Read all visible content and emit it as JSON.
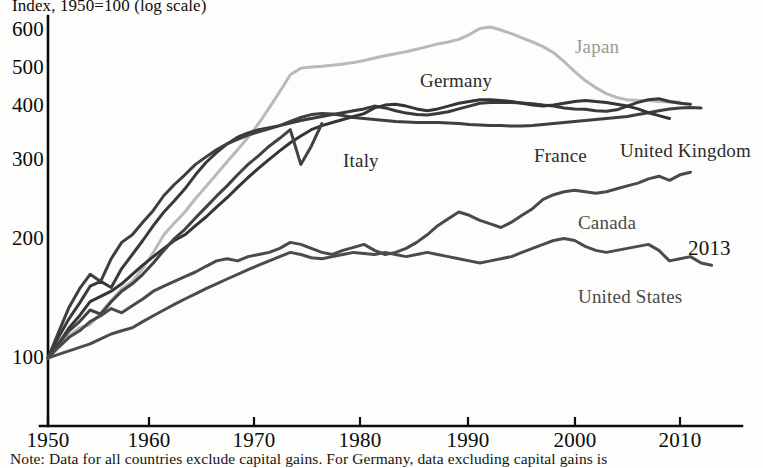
{
  "chart_data": {
    "type": "line",
    "title": "Index, 1950=100 (log scale)",
    "xlabel": "",
    "ylabel": "",
    "scale": "log",
    "grid": false,
    "legend_position": "inline-annotations",
    "xlim": [
      1950,
      2013
    ],
    "ylim": [
      90,
      650
    ],
    "x_ticks": [
      "1950",
      "1960",
      "1970",
      "1980",
      "1990",
      "2000",
      "2010"
    ],
    "y_ticks": [
      "100",
      "200",
      "300",
      "400",
      "500",
      "600"
    ],
    "end_year_annotation": "2013",
    "note": "Note: Data for all countries exclude capital gains. For Germany, data excluding capital gains is",
    "series": [
      {
        "name": "Japan",
        "color": "#b9b9b9",
        "label_x": 575,
        "label_y": 36,
        "x": [
          1950,
          1951,
          1952,
          1953,
          1954,
          1955,
          1956,
          1957,
          1958,
          1959,
          1960,
          1961,
          1962,
          1963,
          1964,
          1965,
          1966,
          1967,
          1968,
          1969,
          1970,
          1971,
          1972,
          1973,
          1974,
          1975,
          1976,
          1977,
          1978,
          1979,
          1980,
          1981,
          1982,
          1983,
          1984,
          1985,
          1986,
          1987,
          1988,
          1989,
          1990,
          1991,
          1992,
          1993,
          1994,
          1995,
          1996,
          1997,
          1998,
          1999,
          2000,
          2001,
          2002,
          2003,
          2004,
          2005,
          2006,
          2007,
          2008,
          2009,
          2010
        ],
        "values": [
          100,
          106,
          113,
          118,
          120,
          128,
          137,
          146,
          152,
          163,
          178,
          196,
          209,
          222,
          239,
          255,
          273,
          292,
          312,
          334,
          360,
          392,
          428,
          470,
          487,
          490,
          492,
          495,
          498,
          502,
          508,
          515,
          521,
          527,
          533,
          540,
          548,
          556,
          562,
          570,
          585,
          605,
          610,
          600,
          588,
          575,
          562,
          548,
          530,
          505,
          478,
          455,
          438,
          424,
          415,
          410,
          408,
          408,
          406,
          405,
          405
        ]
      },
      {
        "name": "Germany",
        "color": "#3a3a3a",
        "label_x": 420,
        "label_y": 70,
        "x": [
          1950,
          1951,
          1952,
          1953,
          1954,
          1955,
          1956,
          1957,
          1958,
          1959,
          1960,
          1961,
          1962,
          1963,
          1964,
          1965,
          1966,
          1967,
          1968,
          1969,
          1970,
          1971,
          1972,
          1973,
          1974,
          1975,
          1976,
          1977,
          1978,
          1979,
          1980,
          1981,
          1982,
          1983,
          1984,
          1985,
          1986,
          1987,
          1988,
          1989,
          1990,
          1991,
          1992,
          1993,
          1994,
          1995,
          1996,
          1997,
          1998,
          1999,
          2000,
          2001,
          2002,
          2003,
          2004,
          2005,
          2006,
          2007,
          2008,
          2009,
          2010,
          2011
        ],
        "values": [
          100,
          112,
          124,
          135,
          148,
          152,
          147,
          163,
          176,
          190,
          206,
          222,
          236,
          252,
          272,
          291,
          307,
          322,
          334,
          342,
          348,
          352,
          356,
          361,
          366,
          370,
          374,
          378,
          382,
          386,
          390,
          396,
          392,
          386,
          381,
          378,
          377,
          380,
          384,
          390,
          396,
          402,
          404,
          404,
          404,
          403,
          401,
          398,
          396,
          392,
          390,
          389,
          386,
          385,
          388,
          396,
          404,
          410,
          412,
          406,
          402,
          400
        ]
      },
      {
        "name": "France",
        "color": "#3f3f3f",
        "label_x": 534,
        "label_y": 145,
        "x": [
          1950,
          1951,
          1952,
          1953,
          1954,
          1955,
          1956,
          1957,
          1958,
          1959,
          1960,
          1961,
          1962,
          1963,
          1964,
          1965,
          1966,
          1967,
          1968,
          1969,
          1970,
          1971,
          1972,
          1973,
          1974,
          1975,
          1976,
          1977,
          1978,
          1979,
          1980,
          1981,
          1982,
          1983,
          1984,
          1985,
          1986,
          1987,
          1988,
          1989,
          1990,
          1991,
          1992,
          1993,
          1994,
          1995,
          1996,
          1997,
          1998,
          1999,
          2000,
          2001,
          2002,
          2003,
          2004,
          2005,
          2006,
          2007,
          2008,
          2009,
          2010,
          2011,
          2012
        ],
        "values": [
          100,
          115,
          132,
          146,
          158,
          152,
          172,
          188,
          196,
          210,
          224,
          243,
          258,
          272,
          288,
          300,
          312,
          322,
          330,
          338,
          344,
          350,
          356,
          364,
          372,
          378,
          380,
          379,
          376,
          372,
          370,
          368,
          366,
          364,
          363,
          362,
          362,
          362,
          361,
          360,
          358,
          357,
          356,
          356,
          355,
          355,
          356,
          358,
          360,
          362,
          364,
          366,
          368,
          370,
          372,
          374,
          378,
          382,
          386,
          390,
          392,
          393,
          392
        ]
      },
      {
        "name": "United Kingdom",
        "color": "#353535",
        "label_x": 620,
        "label_y": 140,
        "x": [
          1950,
          1951,
          1952,
          1953,
          1954,
          1955,
          1956,
          1957,
          1958,
          1959,
          1960,
          1961,
          1962,
          1963,
          1964,
          1965,
          1966,
          1967,
          1968,
          1969,
          1970,
          1971,
          1972,
          1973,
          1974,
          1975,
          1976,
          1977,
          1978,
          1979,
          1980,
          1981,
          1982,
          1983,
          1984,
          1985,
          1986,
          1987,
          1988,
          1989,
          1990,
          1991,
          1992,
          1993,
          1994,
          1995,
          1996,
          1997,
          1998,
          1999,
          2000,
          2001,
          2002,
          2003,
          2004,
          2005,
          2006,
          2007,
          2008,
          2009
        ],
        "values": [
          100,
          108,
          118,
          126,
          136,
          140,
          144,
          150,
          158,
          166,
          174,
          182,
          190,
          196,
          206,
          216,
          228,
          240,
          254,
          268,
          282,
          296,
          310,
          324,
          336,
          348,
          356,
          362,
          368,
          374,
          380,
          392,
          398,
          400,
          396,
          390,
          386,
          390,
          396,
          402,
          406,
          410,
          410,
          408,
          406,
          402,
          398,
          396,
          398,
          402,
          406,
          408,
          406,
          404,
          400,
          396,
          390,
          382,
          376,
          370
        ]
      },
      {
        "name": "Italy",
        "color": "#424242",
        "label_x": 343,
        "label_y": 150,
        "x": [
          1950,
          1951,
          1952,
          1953,
          1954,
          1955,
          1956,
          1957,
          1958,
          1959,
          1960,
          1961,
          1962,
          1963,
          1964,
          1965,
          1966,
          1967,
          1968,
          1969,
          1970,
          1971,
          1972,
          1973,
          1974,
          1975,
          1976
        ],
        "values": [
          100,
          108,
          116,
          122,
          130,
          127,
          136,
          144,
          150,
          158,
          168,
          180,
          192,
          202,
          215,
          228,
          242,
          256,
          272,
          288,
          302,
          318,
          332,
          348,
          288,
          318,
          360
        ]
      },
      {
        "name": "Canada",
        "color": "#4a4a4a",
        "label_x": 578,
        "label_y": 212,
        "x": [
          1950,
          1951,
          1952,
          1953,
          1954,
          1955,
          1956,
          1957,
          1958,
          1959,
          1960,
          1961,
          1962,
          1963,
          1964,
          1965,
          1966,
          1967,
          1968,
          1969,
          1970,
          1971,
          1972,
          1973,
          1974,
          1975,
          1976,
          1977,
          1978,
          1979,
          1980,
          1981,
          1982,
          1983,
          1984,
          1985,
          1986,
          1987,
          1988,
          1989,
          1990,
          1991,
          1992,
          1993,
          1994,
          1995,
          1996,
          1997,
          1998,
          1999,
          2000,
          2001,
          2002,
          2003,
          2004,
          2005,
          2006,
          2007,
          2008,
          2009,
          2010,
          2011
        ],
        "values": [
          100,
          106,
          112,
          116,
          122,
          126,
          131,
          128,
          133,
          138,
          144,
          148,
          152,
          156,
          160,
          165,
          170,
          172,
          170,
          174,
          176,
          178,
          182,
          188,
          186,
          182,
          178,
          176,
          180,
          183,
          186,
          180,
          176,
          178,
          182,
          188,
          196,
          206,
          214,
          222,
          218,
          212,
          208,
          204,
          210,
          218,
          226,
          238,
          244,
          248,
          250,
          248,
          246,
          248,
          252,
          256,
          260,
          266,
          270,
          264,
          272,
          276
        ]
      },
      {
        "name": "United States",
        "color": "#4c4c4c",
        "label_x": 578,
        "label_y": 286,
        "x": [
          1950,
          1951,
          1952,
          1953,
          1954,
          1955,
          1956,
          1957,
          1958,
          1959,
          1960,
          1961,
          1962,
          1963,
          1964,
          1965,
          1966,
          1967,
          1968,
          1969,
          1970,
          1971,
          1972,
          1973,
          1974,
          1975,
          1976,
          1977,
          1978,
          1979,
          1980,
          1981,
          1982,
          1983,
          1984,
          1985,
          1986,
          1987,
          1988,
          1989,
          1990,
          1991,
          1992,
          1993,
          1994,
          1995,
          1996,
          1997,
          1998,
          1999,
          2000,
          2001,
          2002,
          2003,
          2004,
          2005,
          2006,
          2007,
          2008,
          2009,
          2010,
          2011,
          2012,
          2013
        ],
        "values": [
          100,
          102,
          104,
          106,
          108,
          111,
          114,
          116,
          118,
          122,
          126,
          130,
          134,
          138,
          142,
          146,
          150,
          154,
          158,
          162,
          166,
          170,
          174,
          178,
          176,
          173,
          172,
          174,
          176,
          178,
          177,
          176,
          178,
          176,
          174,
          176,
          178,
          176,
          174,
          172,
          170,
          168,
          170,
          172,
          174,
          178,
          182,
          186,
          190,
          192,
          190,
          184,
          180,
          178,
          180,
          182,
          184,
          186,
          180,
          170,
          172,
          174,
          168,
          166
        ]
      }
    ]
  },
  "axis": {
    "x_tick_px": {
      "1950": 48,
      "1960": 149,
      "1970": 254,
      "1980": 360,
      "1990": 468,
      "2000": 575,
      "2010": 680
    },
    "y_tick_px": {
      "600": 30,
      "500": 68,
      "400": 106,
      "300": 160,
      "200": 239,
      "100": 358
    }
  }
}
